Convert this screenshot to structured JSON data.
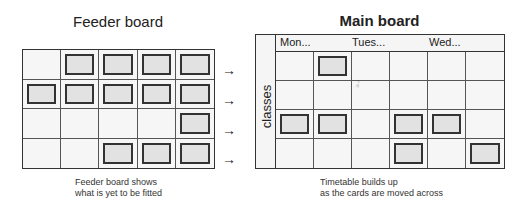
{
  "feeder": {
    "title": "Feeder board",
    "caption_line1": "Feeder board shows",
    "caption_line2": "what is yet to be fitted",
    "rows": 4,
    "cols": 5,
    "cards": [
      [
        0,
        1,
        1,
        1,
        1
      ],
      [
        1,
        1,
        1,
        1,
        1
      ],
      [
        0,
        0,
        0,
        0,
        1
      ],
      [
        0,
        0,
        1,
        1,
        1
      ]
    ],
    "arrow_glyph": "→"
  },
  "main": {
    "title": "Main board",
    "days": [
      "Mon...",
      "Tues...",
      "Wed..."
    ],
    "row_label": "classes",
    "caption_line1": "Timetable builds up",
    "caption_line2": "as the cards are moved across",
    "rows": 4,
    "cols": 6,
    "cards": [
      [
        0,
        1,
        0,
        0,
        0,
        0
      ],
      [
        0,
        0,
        0,
        0,
        0,
        0
      ],
      [
        1,
        1,
        0,
        1,
        1,
        0
      ],
      [
        0,
        0,
        0,
        1,
        0,
        1
      ]
    ]
  },
  "colors": {
    "card_fill": "#e2e2e2",
    "card_border": "#333333",
    "cell_fill": "#f6f6f6"
  }
}
